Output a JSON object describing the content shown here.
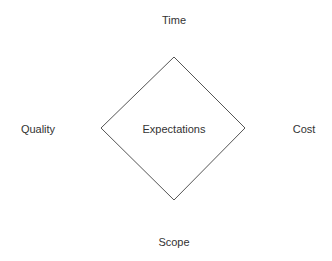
{
  "diagram": {
    "center_label": "Expectations",
    "labels": {
      "top": "Time",
      "left": "Quality",
      "right": "Cost",
      "bottom": "Scope"
    },
    "stroke_color": "#555555",
    "text_color": "#333333"
  }
}
